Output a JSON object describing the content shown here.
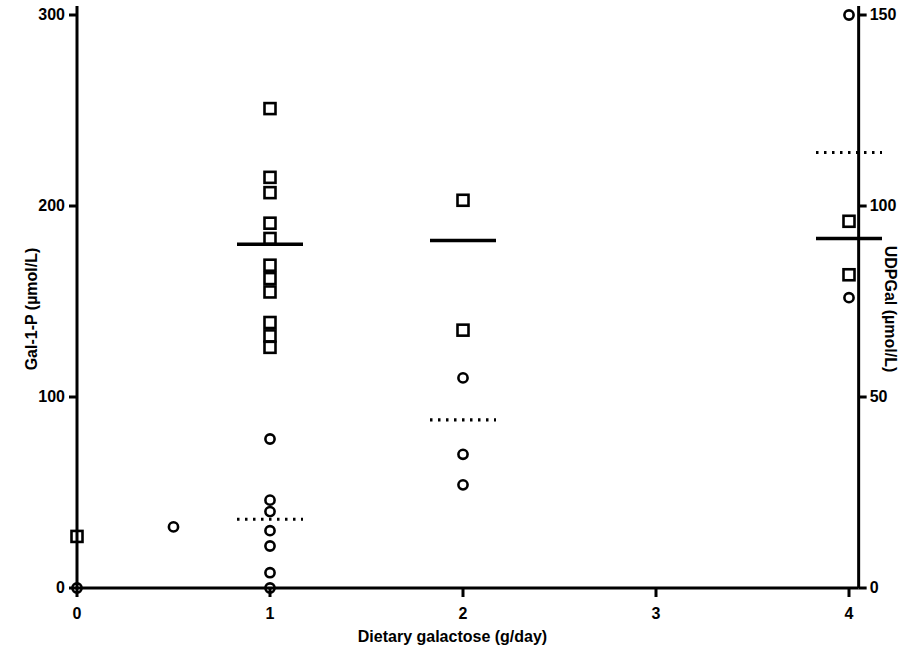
{
  "chart_data": {
    "type": "scatter",
    "title": "",
    "xlabel": "Dietary galactose (g/day)",
    "ylabel": "Gal-1-P (µmol/L)",
    "ylabel_right": "UDPGal (µmol/L)",
    "xlim": [
      0,
      4.35
    ],
    "ylim": [
      0,
      300
    ],
    "ylim_right": [
      0,
      150
    ],
    "xticks": [
      0,
      1,
      2,
      3,
      4
    ],
    "xticklabels": [
      "0",
      "1",
      "2",
      "3",
      "4"
    ],
    "yticks": [
      0,
      100,
      200,
      300
    ],
    "yticklabels": [
      "0",
      "100",
      "200",
      "300"
    ],
    "yticks_right": [
      0,
      50,
      100,
      150
    ],
    "yticklabels_right": [
      "0",
      "50",
      "100",
      "150"
    ],
    "grid": false,
    "legend": "none",
    "series": [
      {
        "name": "Gal-1-P",
        "marker": "open-square",
        "axis": "left",
        "points": [
          {
            "x": 0,
            "y": 27
          },
          {
            "x": 1,
            "y": 251
          },
          {
            "x": 1,
            "y": 215
          },
          {
            "x": 1,
            "y": 207
          },
          {
            "x": 1,
            "y": 191
          },
          {
            "x": 1,
            "y": 183
          },
          {
            "x": 1,
            "y": 169
          },
          {
            "x": 1,
            "y": 162
          },
          {
            "x": 1,
            "y": 155
          },
          {
            "x": 1,
            "y": 139
          },
          {
            "x": 1,
            "y": 132
          },
          {
            "x": 1,
            "y": 126
          },
          {
            "x": 2,
            "y": 203
          },
          {
            "x": 2,
            "y": 135
          },
          {
            "x": 4,
            "y": 192
          },
          {
            "x": 4,
            "y": 164
          }
        ]
      },
      {
        "name": "UDPGal",
        "marker": "open-circle",
        "axis": "right",
        "points": [
          {
            "x": 0,
            "y": 0
          },
          {
            "x": 0.5,
            "y": 16
          },
          {
            "x": 1,
            "y": 39
          },
          {
            "x": 1,
            "y": 23
          },
          {
            "x": 1,
            "y": 20
          },
          {
            "x": 1,
            "y": 15
          },
          {
            "x": 1,
            "y": 11
          },
          {
            "x": 1,
            "y": 4
          },
          {
            "x": 1,
            "y": 0
          },
          {
            "x": 2,
            "y": 55
          },
          {
            "x": 2,
            "y": 35
          },
          {
            "x": 2,
            "y": 27
          },
          {
            "x": 4,
            "y": 150
          },
          {
            "x": 4,
            "y": 76
          }
        ]
      }
    ],
    "mean_lines_solid": [
      {
        "x": 1,
        "y": 180,
        "axis": "left",
        "label": "Gal-1-P mean"
      },
      {
        "x": 2,
        "y": 182,
        "axis": "left",
        "label": "Gal-1-P mean"
      },
      {
        "x": 4,
        "y": 183,
        "axis": "left",
        "label": "Gal-1-P mean"
      }
    ],
    "mean_lines_dotted": [
      {
        "x": 1,
        "y": 18,
        "axis": "right",
        "label": "UDPGal mean"
      },
      {
        "x": 2,
        "y": 44,
        "axis": "right",
        "label": "UDPGal mean"
      },
      {
        "x": 4,
        "y": 114,
        "axis": "right",
        "label": "UDPGal mean"
      }
    ],
    "annotations": []
  },
  "axes": {
    "left_title": "Gal-1-P (µmol/L)",
    "right_title": "UDPGal (µmol/L)",
    "bottom_title": "Dietary galactose (g/day)"
  },
  "colors": {
    "axis": "#000000",
    "marker": "#000000",
    "background": "#ffffff"
  }
}
